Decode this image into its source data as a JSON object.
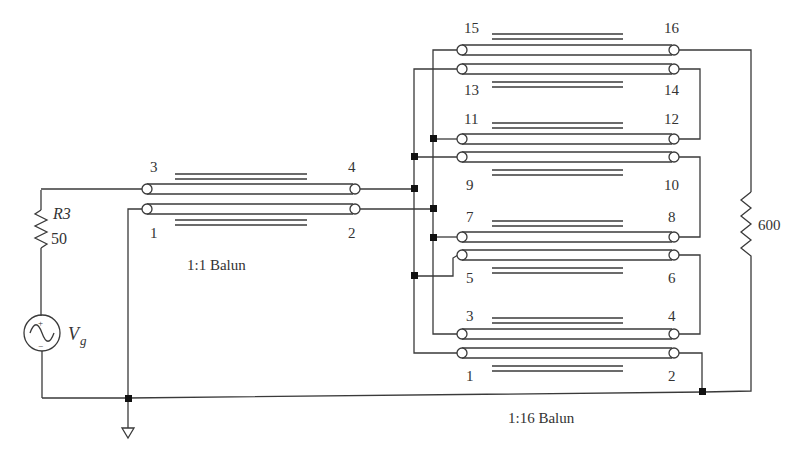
{
  "diagram": {
    "type": "circuit-schematic"
  },
  "source": {
    "resistor_name": "R3",
    "resistor_value": "50",
    "generator_label": "V",
    "generator_subscript": "g",
    "plus_sign": "+",
    "minus_sign": "−"
  },
  "balun_1_1": {
    "caption": "1:1 Balun",
    "pins": {
      "p1": "1",
      "p2": "2",
      "p3": "3",
      "p4": "4"
    }
  },
  "balun_1_16": {
    "caption": "1:16 Balun",
    "pins": {
      "p1": "1",
      "p2": "2",
      "p3": "3",
      "p4": "4",
      "p5": "5",
      "p6": "6",
      "p7": "7",
      "p8": "8",
      "p9": "9",
      "p10": "10",
      "p11": "11",
      "p12": "12",
      "p13": "13",
      "p14": "14",
      "p15": "15",
      "p16": "16"
    }
  },
  "load": {
    "resistor_value": "600"
  },
  "colors": {
    "wire": "#3a3a3a",
    "junction": "#111111",
    "text": "#333333"
  }
}
